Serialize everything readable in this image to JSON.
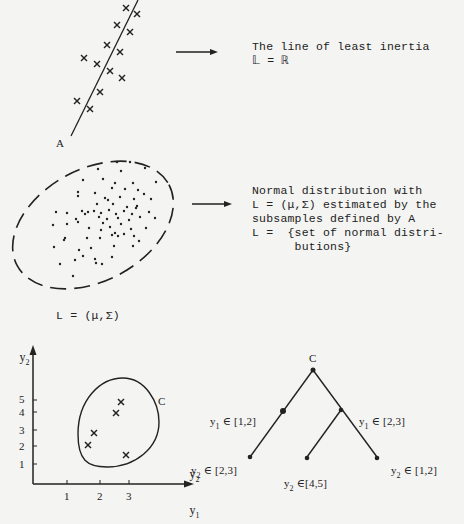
{
  "panel1": {
    "point_label": "A",
    "caption_line1": "The line of least inertia",
    "caption_line2": "𝕃 = ℝ"
  },
  "panel2": {
    "caption_lines": [
      "Normal distribution with",
      "L = (μ,Σ) estimated by the",
      "subsamples defined by A",
      "L =  {set of normal distri-",
      "      butions}"
    ],
    "formula": "L = (μ,Σ)"
  },
  "panel3": {
    "y_axis_label": "y",
    "y_axis_sub": "2",
    "x_axis_label": "y",
    "x_axis_sub": "1",
    "right_label": "y",
    "right_label_sub": "2",
    "y_ticks": [
      "5",
      "4",
      "3",
      "2",
      "1"
    ],
    "x_ticks": [
      "1",
      "2",
      "3"
    ],
    "cluster_label": "C"
  },
  "tree": {
    "root": "C",
    "left_split": {
      "var": "y",
      "sub": "1",
      "cond": "∈ [1,2]"
    },
    "right_split": {
      "var": "y",
      "sub": "1",
      "cond": "∈ [2,3]"
    },
    "leaf1": {
      "var": "y",
      "sub": "2",
      "cond": "∈ [2,3]"
    },
    "leaf2": {
      "var": "y",
      "sub": "2",
      "cond": "∈[4,5]"
    },
    "leaf3": {
      "var": "y",
      "sub": "2",
      "cond": "∈ [1,2]"
    }
  }
}
